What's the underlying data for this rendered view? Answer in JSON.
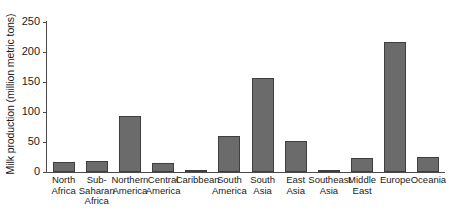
{
  "chart_data": {
    "type": "bar",
    "title": "",
    "xlabel": "",
    "ylabel": "Milk production (million metric tons)",
    "ylim": [
      0,
      250
    ],
    "yticks": [
      0,
      50,
      100,
      150,
      200,
      250
    ],
    "grid": false,
    "legend": "none",
    "categories": [
      "North Africa",
      "Sub-Saharan Africa",
      "Northern America",
      "Central America",
      "Caribbean",
      "South America",
      "South Asia",
      "East Asia",
      "Southeast Asia",
      "Middle East",
      "Europe",
      "Oceania"
    ],
    "category_lines": [
      [
        "North",
        "Africa"
      ],
      [
        "Sub-",
        "Saharan",
        "Africa"
      ],
      [
        "Northern",
        "America"
      ],
      [
        "Central",
        "America"
      ],
      [
        "Caribbean"
      ],
      [
        "South",
        "America"
      ],
      [
        "South",
        "Asia"
      ],
      [
        "East",
        "Asia"
      ],
      [
        "Southeast",
        "Asia"
      ],
      [
        "Middle",
        "East"
      ],
      [
        "Europe"
      ],
      [
        "Oceania"
      ]
    ],
    "values": [
      17,
      18,
      94,
      15,
      2,
      60,
      157,
      52,
      3,
      24,
      217,
      25
    ]
  },
  "style": {
    "bar_fill": "#6b6b6b",
    "bar_stroke": "#3f3f3f",
    "axis_color": "#4a4a4a",
    "text_color": "#1a1a1a",
    "background": "#ffffff"
  },
  "axis": {
    "y_tick_0": "0",
    "y_tick_1": "50",
    "y_tick_2": "100",
    "y_tick_3": "150",
    "y_tick_4": "200",
    "y_tick_5": "250"
  }
}
